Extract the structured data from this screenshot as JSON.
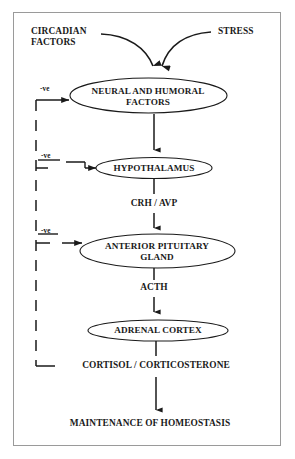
{
  "diagram": {
    "frame": {
      "border_color": "#9a9a9a",
      "background": "#ffffff"
    },
    "line_color": "#1a1a1a",
    "text_color": "#1a1a1a",
    "inputs": [
      {
        "id": "circadian",
        "label_line1": "CIRCADIAN",
        "label_line2": "FACTORS"
      },
      {
        "id": "stress",
        "label": "STRESS"
      }
    ],
    "nodes": [
      {
        "id": "neural-humoral",
        "line1": "NEURAL AND HUMORAL",
        "line2": "FACTORS",
        "shape": "ellipse"
      },
      {
        "id": "hypothalamus",
        "line1": "HYPOTHALAMUS",
        "line2": "",
        "shape": "ellipse"
      },
      {
        "id": "anterior-pituitary",
        "line1": "ANTERIOR PITUITARY",
        "line2": "GLAND",
        "shape": "ellipse"
      },
      {
        "id": "adrenal-cortex",
        "line1": "ADRENAL CORTEX",
        "line2": "",
        "shape": "ellipse"
      }
    ],
    "mediators": [
      {
        "id": "crh-avp",
        "label": "CRH / AVP"
      },
      {
        "id": "acth",
        "label": "ACTH"
      },
      {
        "id": "cortisol",
        "label": "CORTISOL / CORTICOSTERONE"
      }
    ],
    "feedback": {
      "labels": [
        {
          "id": "neg-neural",
          "label": "-ve"
        },
        {
          "id": "neg-hypothalamus",
          "label": "-ve"
        },
        {
          "id": "neg-pituitary",
          "label": "-ve"
        }
      ],
      "style": "dashed"
    },
    "outcome": {
      "id": "homeostasis",
      "label": "MAINTENANCE OF HOMEOSTASIS"
    }
  }
}
